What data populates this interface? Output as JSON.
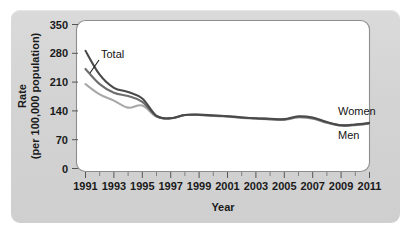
{
  "figure": {
    "background_color": "#d5d5d5",
    "plot_background_color": "#ffffff"
  },
  "chart_data": {
    "type": "line",
    "title": "",
    "subtitle": "",
    "xlabel": "Year",
    "ylabel": "Rate\n(per 100,000 population)",
    "ylabel_line1": "Rate",
    "ylabel_line2": "(per 100,000 population)",
    "grid": false,
    "legend_position": "inline-right-annotations",
    "xlim": [
      1991,
      2011
    ],
    "ylim": [
      0,
      350
    ],
    "x_tick_labels": [
      "1991",
      "1993",
      "1995",
      "1997",
      "1999",
      "2001",
      "2003",
      "2005",
      "2007",
      "2009",
      "2011"
    ],
    "x_ticks": [
      1991,
      1993,
      1995,
      1997,
      1999,
      2001,
      2003,
      2005,
      2007,
      2009,
      2011
    ],
    "x_minor_ticks": [
      1992,
      1994,
      1996,
      1998,
      2000,
      2002,
      2004,
      2006,
      2008,
      2010
    ],
    "y_tick_labels": [
      "0",
      "70",
      "140",
      "210",
      "280",
      "350"
    ],
    "y_ticks": [
      0,
      70,
      140,
      210,
      280,
      350
    ],
    "x": [
      1991,
      1992,
      1993,
      1994,
      1995,
      1996,
      1997,
      1998,
      1999,
      2000,
      2001,
      2002,
      2003,
      2004,
      2005,
      2006,
      2007,
      2008,
      2009,
      2010,
      2011
    ],
    "series": [
      {
        "name": "Total",
        "color": "#6e6e6e",
        "values": [
          242,
          205,
          184,
          176,
          162,
          127,
          122,
          130,
          130,
          129,
          127,
          124,
          122,
          120,
          119,
          125,
          122,
          112,
          105,
          106,
          110
        ]
      },
      {
        "name": "Men",
        "color": "#4a4a4a",
        "values": [
          286,
          228,
          196,
          186,
          170,
          128,
          122,
          130,
          131,
          129,
          127,
          124,
          122,
          121,
          120,
          127,
          124,
          113,
          105,
          107,
          111
        ]
      },
      {
        "name": "Women",
        "color": "#a8a8a8",
        "values": [
          205,
          180,
          165,
          148,
          153,
          126,
          122,
          130,
          130,
          128,
          126,
          123,
          121,
          119,
          118,
          124,
          121,
          111,
          104,
          105,
          109
        ]
      }
    ],
    "annotations": [
      {
        "text": "Total",
        "series": "Total",
        "kind": "callout-with-leader"
      },
      {
        "text": "Women",
        "series": "Women",
        "kind": "end-label-above"
      },
      {
        "text": "Men",
        "series": "Men",
        "kind": "end-label-below"
      }
    ]
  }
}
